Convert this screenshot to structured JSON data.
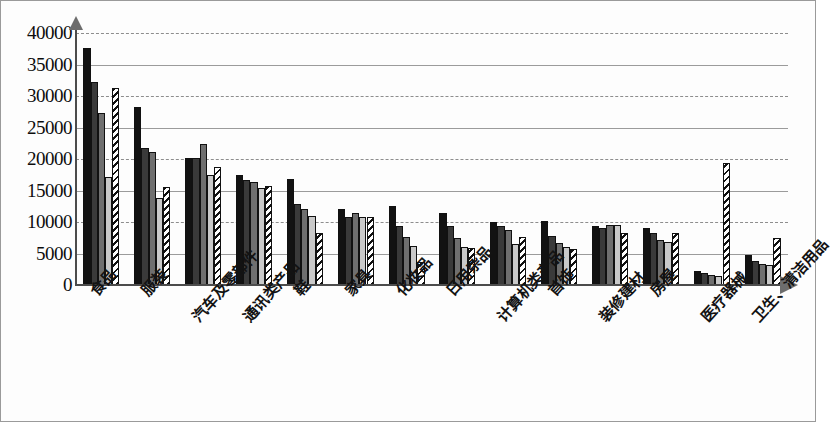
{
  "chart_data": {
    "type": "bar",
    "title": "",
    "subtitle": "",
    "xlabel": "",
    "ylabel": "",
    "ylim": [
      0,
      40000
    ],
    "ytick_step": 5000,
    "yticks": [
      "40000",
      "35000",
      "30000",
      "25000",
      "20000",
      "15000",
      "10000",
      "5000",
      "0"
    ],
    "grid": true,
    "grid_orientation": "horizontal",
    "legend": "none",
    "legend_position": "none",
    "categories": [
      "食品",
      "服装",
      "汽车及零部件",
      "通讯类产品",
      "鞋",
      "家具",
      "化妆品",
      "日用杂品",
      "计算机类产品",
      "首饰",
      "装修建材",
      "房屋",
      "医疗器械",
      "卫生、清洁用品"
    ],
    "series": [
      {
        "name": "series-1",
        "fill": "solid-black",
        "color": "#121212",
        "values": [
          37700,
          28200,
          20200,
          17500,
          16800,
          12000,
          12500,
          11400,
          10000,
          10200,
          9300,
          9000,
          2300,
          4700
        ]
      },
      {
        "name": "series-2",
        "fill": "solid-dark-gray",
        "color": "#3a3a3a",
        "values": [
          32200,
          21800,
          20200,
          16700,
          12900,
          10800,
          9300,
          9400,
          9400,
          7800,
          9100,
          8200,
          1900,
          3800
        ]
      },
      {
        "name": "series-3",
        "fill": "solid-mid-gray",
        "color": "#6f6f6f",
        "values": [
          27300,
          21100,
          22400,
          16300,
          12000,
          11500,
          7700,
          7500,
          8700,
          6600,
          9600,
          7100,
          1600,
          3300
        ]
      },
      {
        "name": "series-4",
        "fill": "solid-light-gray",
        "color": "#c9c9c9",
        "values": [
          17100,
          13800,
          17500,
          15400,
          11000,
          10800,
          6200,
          6000,
          6500,
          6100,
          9500,
          6800,
          1500,
          3100
        ]
      },
      {
        "name": "series-5",
        "fill": "diagonal-hatch",
        "color": "#ffffff",
        "values": [
          31200,
          15500,
          18800,
          15700,
          8300,
          10800,
          3700,
          5800,
          7600,
          5700,
          8200,
          8200,
          19300,
          7500
        ]
      }
    ]
  },
  "axes": {
    "y_axis_name": "y-axis-with-arrow",
    "x_axis_name": "x-axis-with-arrow"
  }
}
